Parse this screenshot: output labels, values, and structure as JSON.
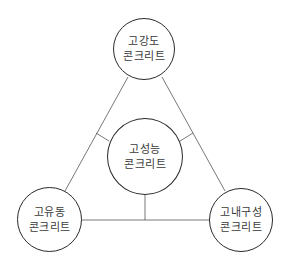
{
  "diagram": {
    "type": "triangle-concept-map",
    "center_node": {
      "line1": "고성능",
      "line2": "콘크리트"
    },
    "nodes": [
      {
        "position": "top",
        "line1": "고강도",
        "line2": "콘크리트"
      },
      {
        "position": "bottom-left",
        "line1": "고유동",
        "line2": "콘크리트"
      },
      {
        "position": "bottom-right",
        "line1": "고내구성",
        "line2": "콘크리트"
      }
    ],
    "colors": {
      "stroke": "#2a2a2a",
      "text": "#3a3a3a",
      "background": "#ffffff"
    }
  }
}
